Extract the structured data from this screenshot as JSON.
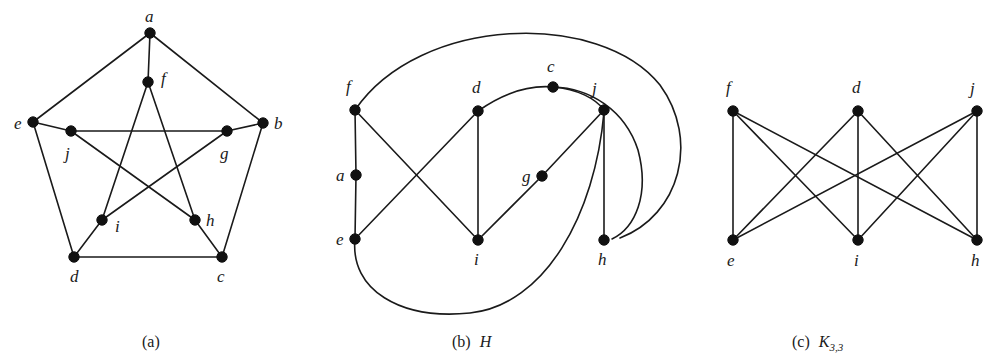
{
  "figure": {
    "background_color": "#ffffff",
    "edge_color": "#1a1a1a",
    "vertex_color": "#111111"
  },
  "panels": [
    {
      "id": "panel-a",
      "caption_label": "(a)",
      "caption_name": "",
      "caption_sub": "",
      "graph_name": "Petersen graph",
      "vertices": [
        {
          "id": "a",
          "label": "a",
          "x": 150,
          "y": 33,
          "lx": 145,
          "ly": 22
        },
        {
          "id": "b",
          "label": "b",
          "x": 263,
          "y": 123,
          "lx": 274,
          "ly": 129
        },
        {
          "id": "c",
          "label": "c",
          "x": 222,
          "y": 257,
          "lx": 217,
          "ly": 282
        },
        {
          "id": "d",
          "label": "d",
          "x": 74,
          "y": 257,
          "lx": 70,
          "ly": 282
        },
        {
          "id": "e",
          "label": "e",
          "x": 33,
          "y": 122,
          "lx": 14,
          "ly": 129
        },
        {
          "id": "f",
          "label": "f",
          "x": 148,
          "y": 82,
          "lx": 161,
          "ly": 84
        },
        {
          "id": "g",
          "label": "g",
          "x": 227,
          "y": 131,
          "lx": 220,
          "ly": 159
        },
        {
          "id": "h",
          "label": "h",
          "x": 195,
          "y": 220,
          "lx": 206,
          "ly": 226
        },
        {
          "id": "i",
          "label": "i",
          "x": 102,
          "y": 220,
          "lx": 115,
          "ly": 232
        },
        {
          "id": "j",
          "label": "j",
          "x": 71,
          "y": 131,
          "lx": 65,
          "ly": 159
        }
      ],
      "edges": [
        {
          "from": "a",
          "to": "b"
        },
        {
          "from": "b",
          "to": "c"
        },
        {
          "from": "c",
          "to": "d"
        },
        {
          "from": "d",
          "to": "e"
        },
        {
          "from": "e",
          "to": "a"
        },
        {
          "from": "a",
          "to": "f"
        },
        {
          "from": "b",
          "to": "g"
        },
        {
          "from": "c",
          "to": "h"
        },
        {
          "from": "d",
          "to": "i"
        },
        {
          "from": "e",
          "to": "j"
        },
        {
          "from": "f",
          "to": "h"
        },
        {
          "from": "h",
          "to": "j"
        },
        {
          "from": "j",
          "to": "g"
        },
        {
          "from": "g",
          "to": "i"
        },
        {
          "from": "i",
          "to": "f"
        }
      ]
    },
    {
      "id": "panel-b",
      "caption_label": "(b)",
      "caption_name": "H",
      "caption_sub": "",
      "graph_name": "H",
      "vertices": [
        {
          "id": "f",
          "label": "f",
          "x": 355,
          "y": 110,
          "lx": 346,
          "ly": 92
        },
        {
          "id": "a",
          "label": "a",
          "x": 356,
          "y": 175,
          "lx": 336,
          "ly": 181
        },
        {
          "id": "e",
          "label": "e",
          "x": 355,
          "y": 239,
          "lx": 336,
          "ly": 245
        },
        {
          "id": "d",
          "label": "d",
          "x": 478,
          "y": 111,
          "lx": 472,
          "ly": 93
        },
        {
          "id": "i",
          "label": "i",
          "x": 478,
          "y": 240,
          "lx": 474,
          "ly": 265
        },
        {
          "id": "c",
          "label": "c",
          "x": 553,
          "y": 87,
          "lx": 547,
          "ly": 72
        },
        {
          "id": "g",
          "label": "g",
          "x": 542,
          "y": 176,
          "lx": 522,
          "ly": 182
        },
        {
          "id": "j",
          "label": "j",
          "x": 604,
          "y": 110,
          "lx": 592,
          "ly": 94
        },
        {
          "id": "h",
          "label": "h",
          "x": 604,
          "y": 240,
          "lx": 598,
          "ly": 265
        }
      ],
      "straight_edges": [
        {
          "from": "f",
          "to": "a"
        },
        {
          "from": "a",
          "to": "e"
        },
        {
          "from": "f",
          "to": "i"
        },
        {
          "from": "d",
          "to": "e"
        },
        {
          "from": "d",
          "to": "i"
        },
        {
          "from": "i",
          "to": "g"
        },
        {
          "from": "g",
          "to": "j"
        },
        {
          "from": "j",
          "to": "h"
        }
      ],
      "curved_edges": [
        {
          "from": "f",
          "to": "h",
          "path": "M 355 110 C 420 15 600 10 660 85 C 700 140 680 215 620 238"
        },
        {
          "from": "d",
          "to": "j",
          "path": "M 478 111 C 505 92 530 85 553 87 C 578 89 596 99 604 110"
        },
        {
          "from": "c",
          "to": "h",
          "path": "M 553 87 C 590 88 625 110 638 150 C 650 195 635 228 612 239"
        },
        {
          "from": "e",
          "to": "j",
          "path": "M 355 239 C 350 290 400 320 470 313 C 545 305 595 215 604 112"
        }
      ]
    },
    {
      "id": "panel-c",
      "caption_label": "(c)",
      "caption_name": "K",
      "caption_sub": "3,3",
      "graph_name": "K3,3",
      "vertices": [
        {
          "id": "f",
          "label": "f",
          "x": 733,
          "y": 111,
          "lx": 726,
          "ly": 93
        },
        {
          "id": "d",
          "label": "d",
          "x": 858,
          "y": 111,
          "lx": 852,
          "ly": 93
        },
        {
          "id": "j",
          "label": "j",
          "x": 977,
          "y": 111,
          "lx": 970,
          "ly": 94
        },
        {
          "id": "e",
          "label": "e",
          "x": 733,
          "y": 240,
          "lx": 727,
          "ly": 266
        },
        {
          "id": "i",
          "label": "i",
          "x": 858,
          "y": 240,
          "lx": 854,
          "ly": 266
        },
        {
          "id": "h",
          "label": "h",
          "x": 977,
          "y": 240,
          "lx": 971,
          "ly": 266
        }
      ],
      "edges": [
        {
          "from": "f",
          "to": "e"
        },
        {
          "from": "f",
          "to": "i"
        },
        {
          "from": "f",
          "to": "h"
        },
        {
          "from": "d",
          "to": "e"
        },
        {
          "from": "d",
          "to": "i"
        },
        {
          "from": "d",
          "to": "h"
        },
        {
          "from": "j",
          "to": "e"
        },
        {
          "from": "j",
          "to": "i"
        },
        {
          "from": "j",
          "to": "h"
        }
      ]
    }
  ],
  "captions": [
    {
      "id": "caption-a",
      "label": "(a)",
      "name": "",
      "sub": "",
      "x": 142,
      "y": 333
    },
    {
      "id": "caption-b",
      "label": "(b)",
      "name": "H",
      "sub": "",
      "x": 452,
      "y": 333
    },
    {
      "id": "caption-c",
      "label": "(c)",
      "name": "K",
      "sub": "3,3",
      "x": 792,
      "y": 333
    }
  ]
}
